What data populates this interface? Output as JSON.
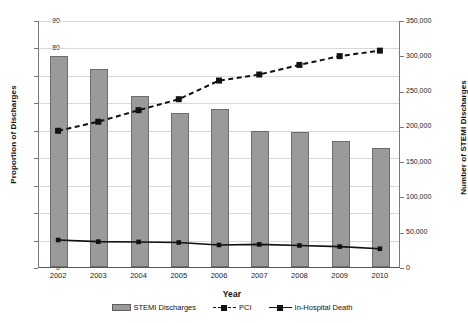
{
  "chart_data": {
    "type": "bar",
    "title": "",
    "xlabel": "Year",
    "ylabel": "Proportion of Discharges",
    "y2label": "Number of STEMI Discharges",
    "categories": [
      "2002",
      "2003",
      "2004",
      "2005",
      "2006",
      "2007",
      "2008",
      "2009",
      "2010"
    ],
    "ylim": [
      0,
      90
    ],
    "yticks": [
      "0",
      "10",
      "20",
      "30",
      "40",
      "50",
      "60",
      "70",
      "80",
      "90"
    ],
    "y2lim": [
      0,
      350000
    ],
    "y2ticks": [
      "0",
      "50,000",
      "100,000",
      "150,000",
      "200,000",
      "250,000",
      "300,000",
      "350,000"
    ],
    "grid": true,
    "legend_position": "bottom",
    "series": [
      {
        "name": "STEMI Discharges",
        "render": "bar",
        "axis": "right",
        "unit": "discharges",
        "values": [
          299000,
          281000,
          242000,
          219000,
          224000,
          193000,
          192000,
          179000,
          169000
        ],
        "values_left_scale": [
          77.0,
          72.2,
          62.2,
          56.3,
          57.6,
          49.7,
          49.3,
          46.0,
          43.5
        ],
        "color": "#9a9a9a"
      },
      {
        "name": "PCI",
        "render": "line-dashed",
        "axis": "left",
        "unit": "percent",
        "values": [
          50.0,
          53.3,
          57.5,
          61.5,
          68.3,
          70.5,
          74.0,
          77.2,
          79.2
        ],
        "color": "#111111"
      },
      {
        "name": "In-Hospital Death",
        "render": "line-solid",
        "axis": "left",
        "unit": "percent",
        "values": [
          10.2,
          9.6,
          9.5,
          9.3,
          8.4,
          8.6,
          8.2,
          7.8,
          7.0
        ],
        "color": "#111111"
      }
    ]
  },
  "legend": {
    "items": [
      {
        "label": "STEMI Discharges"
      },
      {
        "label": "PCI"
      },
      {
        "label": "In-Hospital Death"
      }
    ]
  }
}
